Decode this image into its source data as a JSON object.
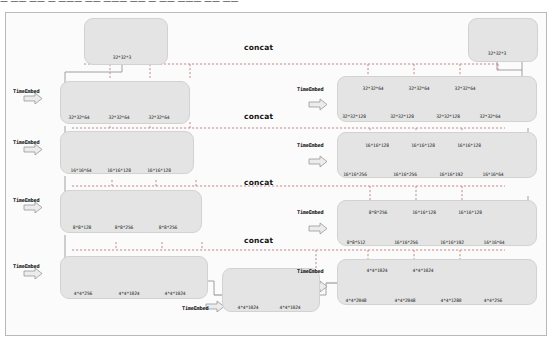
{
  "diagram": {
    "top_text": "— —— —— — ——— —— ——— —— — —— ——— —— ——",
    "labels": {
      "time_embed": "TimeEmbed",
      "concat": "concat"
    },
    "colors": {
      "panel_fill": "#e4e4e4",
      "panel_stroke": "#d2d2d2",
      "cube_front": "#b7b7b7",
      "cube_top": "#d8d8d8",
      "cube_side": "#8f8f8f",
      "cube_stroke": "#6e6e6e",
      "skip_line": "#c58d8d",
      "arrow_gray": "#8a8a8a",
      "outer_border": "#b9b9b9",
      "background": "#fbfbfb"
    },
    "encoder": {
      "name": "encoder-column",
      "stages": [
        {
          "name": "input-stage",
          "time_embed": false,
          "blocks": [
            {
              "label": "32*32*3",
              "shape": "cube-small"
            }
          ]
        },
        {
          "name": "encoder-stage-1",
          "time_embed": true,
          "blocks": [
            {
              "label": "32*32*64",
              "shape": "cube-small"
            },
            {
              "label": "32*32*64",
              "shape": "cube-small"
            },
            {
              "label": "32*32*64",
              "shape": "cube-small"
            }
          ]
        },
        {
          "name": "encoder-stage-2",
          "time_embed": true,
          "blocks": [
            {
              "label": "16*16*64",
              "shape": "cube-med"
            },
            {
              "label": "16*16*128",
              "shape": "cube-med"
            },
            {
              "label": "16*16*128",
              "shape": "cube-med"
            }
          ]
        },
        {
          "name": "encoder-stage-3",
          "time_embed": true,
          "blocks": [
            {
              "label": "8*8*128",
              "shape": "bar-med"
            },
            {
              "label": "8*8*256",
              "shape": "bar-med"
            },
            {
              "label": "8*8*256",
              "shape": "bar-med"
            }
          ]
        },
        {
          "name": "encoder-stage-4",
          "time_embed": true,
          "blocks": [
            {
              "label": "4*4*256",
              "shape": "bar-long"
            },
            {
              "label": "4*4*1024",
              "shape": "bar-long"
            },
            {
              "label": "4*4*1024",
              "shape": "bar-long"
            }
          ]
        }
      ]
    },
    "bottleneck": {
      "name": "bottleneck-stage",
      "time_embed": true,
      "blocks": [
        {
          "label": "4*4*1024",
          "shape": "bar-long-dark"
        },
        {
          "label": "4*4*1024",
          "shape": "bar-long-dark"
        }
      ]
    },
    "decoder": {
      "name": "decoder-column",
      "stages": [
        {
          "name": "output-stage",
          "time_embed": false,
          "blocks": [
            {
              "label": "32*32*3",
              "shape": "cube-small"
            }
          ]
        },
        {
          "name": "decoder-stage-1",
          "time_embed": true,
          "top_labels": [
            "32*32*64",
            "32*32*64",
            "32*32*64"
          ],
          "bottom_labels": [
            "32*32*128",
            "32*32*128",
            "32*32*128",
            "32*32*64"
          ]
        },
        {
          "name": "decoder-stage-2",
          "time_embed": true,
          "top_labels": [
            "16*16*128",
            "16*16*128",
            "16*16*128"
          ],
          "bottom_labels": [
            "16*16*256",
            "16*16*256",
            "16*16*192",
            "16*16*64"
          ]
        },
        {
          "name": "decoder-stage-3",
          "time_embed": true,
          "top_labels": [
            "8*8*256",
            "16*16*128",
            "16*16*128"
          ],
          "bottom_labels": [
            "8*8*512",
            "16*16*256",
            "16*16*192",
            "16*16*64"
          ]
        },
        {
          "name": "decoder-stage-4",
          "time_embed": true,
          "top_labels": [
            "4*4*1024",
            "4*4*1024"
          ],
          "bottom_labels": [
            "4*4*2048",
            "4*4*2048",
            "4*4*1280",
            "4*4*256"
          ]
        }
      ]
    },
    "concat_rows": [
      {
        "name": "concat-label-1",
        "text": "concat"
      },
      {
        "name": "concat-label-2",
        "text": "concat"
      },
      {
        "name": "concat-label-3",
        "text": "concat"
      },
      {
        "name": "concat-label-4",
        "text": "concat"
      }
    ]
  }
}
